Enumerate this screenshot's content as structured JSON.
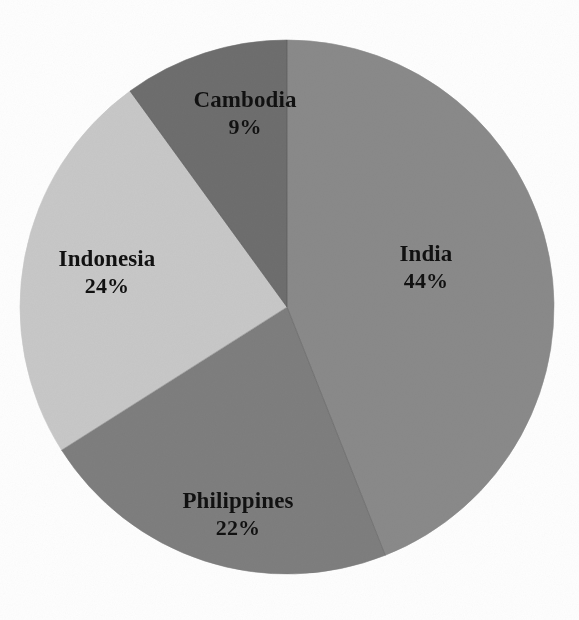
{
  "figure": {
    "background_color": "#fefefe",
    "label_text_color": "#111111"
  },
  "chart_data": {
    "type": "pie",
    "title": "",
    "subtitle": "",
    "xlabel": "",
    "ylabel": "",
    "legend": "none",
    "grid": false,
    "start_angle_deg": 0,
    "direction": "clockwise",
    "center_px": [
      287,
      307
    ],
    "radius_px": 267,
    "categories": [
      "India",
      "Philippines",
      "Indonesia",
      "Cambodia"
    ],
    "values": [
      44,
      22,
      24,
      9
    ],
    "value_unit": "%",
    "total_labeled": 99,
    "colors": [
      "#8a8a8a",
      "#7e7e7e",
      "#c8c8c8",
      "#6e6e6e"
    ],
    "slices": [
      {
        "name": "India",
        "value": 44,
        "label": "India",
        "value_label": "44%",
        "color": "#8a8a8a",
        "start_deg": 0,
        "end_deg": 158.4
      },
      {
        "name": "Philippines",
        "value": 22,
        "label": "Philippines",
        "value_label": "22%",
        "color": "#7e7e7e",
        "start_deg": 158.4,
        "end_deg": 237.6
      },
      {
        "name": "Indonesia",
        "value": 24,
        "label": "Indonesia",
        "value_label": "24%",
        "color": "#c8c8c8",
        "start_deg": 237.6,
        "end_deg": 324.0
      },
      {
        "name": "Cambodia",
        "value": 9,
        "label": "Cambodia",
        "value_label": "9%",
        "color": "#6e6e6e",
        "start_deg": 324.0,
        "end_deg": 360.0
      }
    ]
  }
}
